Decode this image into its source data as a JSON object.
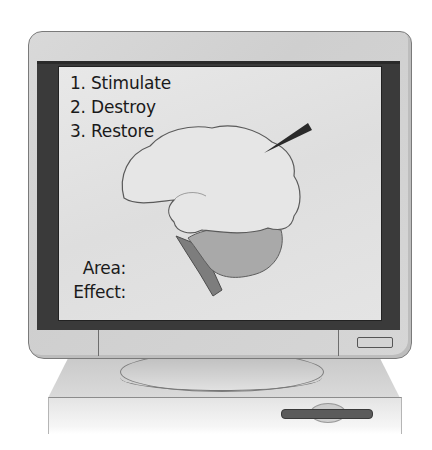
{
  "screen": {
    "procedures": [
      {
        "label": "1. Stimulate"
      },
      {
        "label": "2. Destroy"
      },
      {
        "label": "3. Restore"
      }
    ],
    "fields": {
      "area_label": "Area:",
      "effect_label": "Effect:"
    },
    "illustration": "brain-side-view-with-probe"
  },
  "colors": {
    "bezel": "#d5d5d5",
    "screen_frame": "#3a3a3a",
    "screen_background": "#e3e3e3",
    "brain_cerebrum": "#e6e6e6",
    "brain_cerebellum": "#a9a9a9",
    "brain_stem": "#7d7d7d",
    "probe": "#2a2a2a"
  }
}
